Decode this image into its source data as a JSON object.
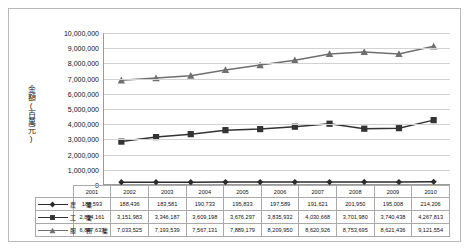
{
  "chart_data": {
    "type": "line",
    "title": "",
    "xlabel": "",
    "ylabel": "金額(百萬元)",
    "ylim": [
      0,
      10000000
    ],
    "ytick_step": 1000000,
    "grid": true,
    "legend_position": "table-left",
    "categories": [
      "2001",
      "2002",
      "2003",
      "2004",
      "2005",
      "2006",
      "2007",
      "2008",
      "2009",
      "2010"
    ],
    "ytick_labels": [
      "10,000,000",
      "9,000,000",
      "8,000,000",
      "7,000,000",
      "6,000,000",
      "5,000,000",
      "4,000,000",
      "3,000,000",
      "2,000,000",
      "1,000,000",
      "0"
    ],
    "series": [
      {
        "name": "農　業",
        "marker": "diamond",
        "color": "#2b2b2b",
        "values": [
          188593,
          188436,
          183581,
          190733,
          195833,
          197589,
          191621,
          201950,
          195008,
          214206
        ],
        "labels": [
          "188,593",
          "188,436",
          "183,581",
          "190,733",
          "195,833",
          "197,589",
          "191,621",
          "201,950",
          "195,008",
          "214,206"
        ]
      },
      {
        "name": "工　業",
        "marker": "square",
        "color": "#333333",
        "values": [
          2854161,
          3151983,
          3346187,
          3609198,
          3676297,
          3835932,
          4030668,
          3701980,
          3740438,
          4267813
        ],
        "labels": [
          "2,854,161",
          "3,151,983",
          "3,346,187",
          "3,609,198",
          "3,676,297",
          "3,835,932",
          "4,030,668",
          "3,701,980",
          "3,740,438",
          "4,267,813"
        ]
      },
      {
        "name": "服　務　業",
        "marker": "triangle",
        "color": "#6f6f6f",
        "values": [
          6887633,
          7033525,
          7193539,
          7567131,
          7889179,
          8209950,
          8620926,
          8753695,
          8621436,
          9121554
        ],
        "labels": [
          "6,887,633",
          "7,033,525",
          "7,193,539",
          "7,567,131",
          "7,889,179",
          "8,209,950",
          "8,620,926",
          "8,753,695",
          "8,621,436",
          "9,121,554"
        ]
      }
    ]
  }
}
